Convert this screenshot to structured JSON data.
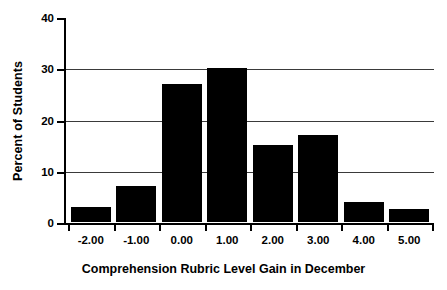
{
  "chart_data": {
    "type": "bar",
    "title": "",
    "xlabel": "Comprehension Rubric Level Gain in December",
    "ylabel": "Percent of Students",
    "categories": [
      "-2.00",
      "-1.00",
      "0.00",
      "1.00",
      "2.00",
      "3.00",
      "4.00",
      "5.00"
    ],
    "values": [
      3,
      7,
      27,
      30,
      15,
      17,
      4,
      2.5
    ],
    "ylim": [
      0,
      40
    ],
    "yticks": [
      "0",
      "10",
      "20",
      "30",
      "40"
    ],
    "ytick_values": [
      0,
      10,
      20,
      30,
      40
    ],
    "gridlines": [
      10,
      20,
      30
    ],
    "grid": true,
    "legend": "none",
    "bar_color": "#000000",
    "background_color": "#FFFFFF",
    "axis_color": "#000000",
    "series": [
      {
        "name": "Percent of Students",
        "values": [
          3,
          7,
          27,
          30,
          15,
          17,
          4,
          2.5
        ]
      }
    ],
    "points": [
      {
        "x": "-2.00",
        "y": 3
      },
      {
        "x": "-1.00",
        "y": 7
      },
      {
        "x": "0.00",
        "y": 27
      },
      {
        "x": "1.00",
        "y": 30
      },
      {
        "x": "2.00",
        "y": 15
      },
      {
        "x": "3.00",
        "y": 17
      },
      {
        "x": "4.00",
        "y": 4
      },
      {
        "x": "5.00",
        "y": 2.5
      }
    ]
  }
}
